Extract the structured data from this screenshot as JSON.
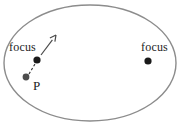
{
  "figure": {
    "background_color": "#ffffff",
    "width": 182,
    "height": 132
  },
  "ellipse": {
    "name": "ellipse-outline",
    "center_x": 90,
    "center_y": 63,
    "radius_x": 86,
    "radius_y": 58,
    "stroke_color": "#8c8c8c",
    "stroke_width": 1.4,
    "fill": "none"
  },
  "labels": {
    "focus_left": "focus",
    "focus_right": "focus",
    "point_p": "P"
  },
  "points": [
    {
      "name": "focus-left-dot",
      "label": "focus",
      "x": 37,
      "y": 60,
      "radius": 3.6,
      "color": "#1a1a1a"
    },
    {
      "name": "focus-right-dot",
      "label": "focus",
      "x": 148,
      "y": 61,
      "radius": 3.6,
      "color": "#1a1a1a"
    },
    {
      "name": "point-p-dot",
      "label": "P",
      "x": 26,
      "y": 77,
      "radius": 3.4,
      "color": "#4d4d4d"
    }
  ],
  "dashed_segment": {
    "name": "dashed-line-p-to-focus",
    "x1": 29,
    "y1": 74,
    "x2": 35,
    "y2": 64,
    "stroke_color": "#333333",
    "stroke_width": 1.1,
    "dash_pattern": "2.5 2"
  },
  "arrow": {
    "name": "direction-arrow",
    "x1": 41,
    "y1": 55,
    "x2": 56,
    "y2": 35,
    "stroke_color": "#4a4a4a",
    "stroke_width": 1.2,
    "head_size": 6
  },
  "chart_data": {
    "type": "scatter",
    "xlabel": "",
    "ylabel": "",
    "grid": false,
    "legend": "none",
    "annotations": [
      "focus",
      "focus",
      "P"
    ],
    "series": [
      {
        "name": "foci",
        "points": [
          {
            "x": 37,
            "y": 60,
            "label": "focus"
          },
          {
            "x": 148,
            "y": 61,
            "label": "focus"
          }
        ]
      },
      {
        "name": "moving-point",
        "points": [
          {
            "x": 26,
            "y": 77,
            "label": "P"
          }
        ]
      }
    ]
  }
}
